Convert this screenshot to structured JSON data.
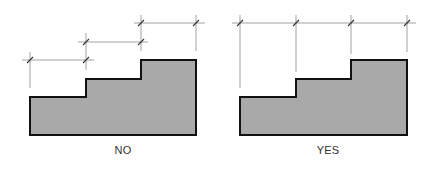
{
  "colors": {
    "shape_fill": "#a9a9a9",
    "shape_stroke": "#111111",
    "dimension_line": "#8a8a8a",
    "tick": "#333333",
    "background": "#ffffff"
  },
  "panels": [
    {
      "label": "NO",
      "label_x": 123,
      "shape_points": "30,135 30,97 86,97 86,79 141,79 141,60 196,60 196,135",
      "dimension_lines": [
        {
          "y": 60,
          "x1": 22,
          "x2": 94,
          "ticks": [
            30,
            86
          ]
        },
        {
          "y": 42,
          "x1": 78,
          "x2": 148,
          "ticks": [
            86,
            141
          ]
        },
        {
          "y": 23,
          "x1": 134,
          "x2": 205,
          "ticks": [
            141,
            196
          ]
        }
      ],
      "extension_lines": [
        {
          "x": 30,
          "y1": 52,
          "y2": 88
        },
        {
          "x": 86,
          "y1": 33,
          "y2": 70
        },
        {
          "x": 141,
          "y1": 15,
          "y2": 51
        },
        {
          "x": 196,
          "y1": 15,
          "y2": 51
        }
      ]
    },
    {
      "label": "YES",
      "label_x": 328,
      "shape_points": "240,135 240,97 296,97 296,79 351,79 351,60 407,60 407,135",
      "dimension_lines": [
        {
          "y": 23,
          "x1": 232,
          "x2": 416,
          "ticks": [
            240,
            296,
            351,
            407
          ]
        }
      ],
      "extension_lines": [
        {
          "x": 240,
          "y1": 15,
          "y2": 88
        },
        {
          "x": 296,
          "y1": 15,
          "y2": 72
        },
        {
          "x": 351,
          "y1": 15,
          "y2": 54
        },
        {
          "x": 407,
          "y1": 15,
          "y2": 52
        }
      ]
    }
  ]
}
